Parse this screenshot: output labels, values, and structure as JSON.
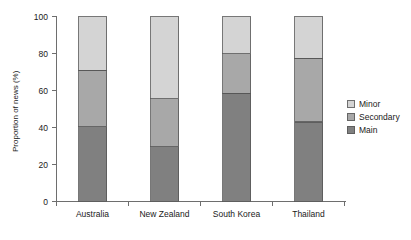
{
  "chart_data": {
    "type": "bar",
    "subtype": "stacked-bar",
    "title": "",
    "xlabel": "",
    "ylabel": "Proportion of news (%)",
    "ylim": [
      0,
      100
    ],
    "yticks": [
      0,
      20,
      40,
      60,
      80,
      100
    ],
    "ytick_labels": [
      "0",
      "20",
      "40",
      "60",
      "80",
      "100"
    ],
    "grid": false,
    "legend_position": "right",
    "categories": [
      "Australia",
      "New Zealand",
      "South Korea",
      "Thailand"
    ],
    "series": [
      {
        "name": "Main",
        "values": [
          40.5,
          29.5,
          58.5,
          43.0
        ],
        "color": "#808080"
      },
      {
        "name": "Secondary",
        "values": [
          30.5,
          26.0,
          21.5,
          34.5
        ],
        "color": "#a8a8a8"
      },
      {
        "name": "Minor",
        "values": [
          29.0,
          44.5,
          20.0,
          22.5
        ],
        "color": "#d4d4d4"
      }
    ],
    "cumulative_tops": {
      "Main": [
        40.5,
        29.5,
        58.5,
        43.0
      ],
      "Secondary": [
        71.0,
        55.5,
        80.0,
        77.5
      ],
      "Minor": [
        100.0,
        100.0,
        100.0,
        100.0
      ]
    },
    "legend_order": [
      "Minor",
      "Secondary",
      "Main"
    ]
  },
  "axis": {
    "y_title": "Proportion of news (%)"
  },
  "legend": {
    "items": [
      {
        "label": "Minor",
        "color": "#d4d4d4"
      },
      {
        "label": "Secondary",
        "color": "#a8a8a8"
      },
      {
        "label": "Main",
        "color": "#808080"
      }
    ]
  }
}
